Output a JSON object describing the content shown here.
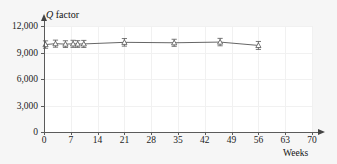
{
  "chart_data": {
    "type": "line",
    "title": "",
    "subtitle": "",
    "xlabel": "Weeks",
    "ylabel": "Q factor",
    "ylabel_parts": {
      "symbol": "Q",
      "rest": " factor"
    },
    "xlim": [
      0,
      70
    ],
    "ylim": [
      0,
      12000
    ],
    "xticks": [
      0,
      7,
      14,
      21,
      28,
      35,
      42,
      49,
      56,
      63,
      70
    ],
    "xtick_labels": [
      "0",
      "7",
      "14",
      "21",
      "28",
      "35",
      "42",
      "49",
      "56",
      "63",
      "70"
    ],
    "yticks": [
      0,
      3000,
      6000,
      9000,
      12000
    ],
    "ytick_labels": [
      "0",
      "3,000",
      "6,000",
      "9,000",
      "12,000"
    ],
    "grid": true,
    "legend": null,
    "marker": "open-triangle",
    "errorbars": true,
    "series": [
      {
        "name": "Q factor",
        "color": "#555555",
        "x": [
          0.4,
          3.0,
          5.6,
          7.6,
          8.8,
          10.4,
          21.0,
          34.0,
          46.0,
          56.0
        ],
        "values": [
          9900,
          10000,
          9950,
          9980,
          9960,
          9970,
          10150,
          10100,
          10180,
          9800
        ],
        "yerr": [
          420,
          400,
          380,
          400,
          380,
          400,
          430,
          400,
          420,
          450
        ]
      }
    ]
  },
  "axes": {
    "x_axis_arrow": "arrow-right",
    "y_axis_arrow": "arrow-up"
  }
}
